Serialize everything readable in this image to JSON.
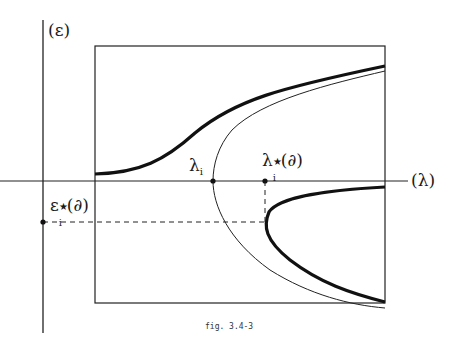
{
  "figure": {
    "caption": "fig. 3.4-3",
    "axes": {
      "y_label": "(ε)",
      "x_label": "(λ)"
    },
    "annotations": {
      "lambda_i": {
        "main": "λ",
        "sub": "i"
      },
      "lambda_i_star": {
        "main": "λ",
        "sub": "i",
        "sup": "★",
        "arg": "(∂)"
      },
      "epsilon_i_star": {
        "main": "ε",
        "sub": "i",
        "sup": "★",
        "arg": "(∂)"
      }
    },
    "curves": [
      {
        "name": "upper-thick-curve",
        "style": "thick",
        "description": "sigmoid rising from left to upper right"
      },
      {
        "name": "thin-parabola",
        "style": "thin",
        "description": "sideways parabola with vertex at λ_i on the λ axis"
      },
      {
        "name": "lower-thick-curve",
        "style": "thick",
        "description": "sideways parabola branch with vertex at λ_i*(∂), below axis"
      }
    ],
    "colors": {
      "ink": "#111111",
      "background": "#ffffff"
    }
  }
}
